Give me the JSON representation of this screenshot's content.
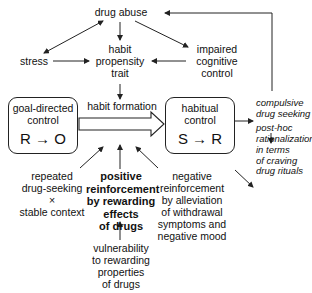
{
  "nodes": {
    "drug_abuse": "drug abuse",
    "stress": "stress",
    "habit_propensity_trait": [
      "habit",
      "propensity",
      "trait"
    ],
    "impaired_cognitive_control": [
      "impaired",
      "cognitive",
      "control"
    ],
    "habit_formation": "habit formation",
    "goal_directed_control": {
      "title": [
        "goal-directed",
        "control"
      ],
      "formula": "R → O"
    },
    "habitual_control": {
      "title": [
        "habitual",
        "control"
      ],
      "formula": "S → R"
    },
    "compulsive_drug_seeking": [
      "compulsive",
      "drug seeking"
    ],
    "post_hoc_rationalization": [
      "post-hoc",
      "rationalization",
      "in terms",
      "of craving"
    ],
    "drug_rituals": "drug rituals",
    "repeated_drug_seeking": [
      "repeated",
      "drug-seeking",
      "×",
      "stable context"
    ],
    "positive_reinforcement": [
      "positive",
      "reinforcement",
      "by rewarding",
      "effects",
      "of drugs"
    ],
    "negative_reinforcement": [
      "negative",
      "reinforcement",
      "by alleviation",
      "of withdrawal",
      "symptoms and",
      "negative mood"
    ],
    "vulnerability": [
      "vulnerability",
      "to rewarding",
      "properties",
      "of drugs"
    ]
  },
  "edges": [
    {
      "from": "drug_abuse",
      "to": "stress",
      "bidirectional": true
    },
    {
      "from": "drug_abuse",
      "to": "habit_propensity_trait"
    },
    {
      "from": "drug_abuse",
      "to": "impaired_cognitive_control"
    },
    {
      "from": "stress",
      "to": "habit_propensity_trait"
    },
    {
      "from": "impaired_cognitive_control",
      "to": "habit_propensity_trait"
    },
    {
      "from": "habit_propensity_trait",
      "to": "habit_formation"
    },
    {
      "from": "goal_directed_control",
      "to": "habitual_control",
      "style": "hollow-block-arrow"
    },
    {
      "from": "repeated_drug_seeking",
      "to": "habit_formation"
    },
    {
      "from": "positive_reinforcement",
      "to": "habit_formation"
    },
    {
      "from": "negative_reinforcement",
      "to": "habit_formation"
    },
    {
      "from": "vulnerability",
      "to": "positive_reinforcement"
    },
    {
      "from": "habitual_control",
      "to": "compulsive_drug_seeking"
    },
    {
      "from": "compulsive_drug_seeking",
      "to": "post_hoc_rationalization"
    },
    {
      "from": "habitual_control",
      "to": "drug_rituals"
    },
    {
      "from": "compulsive_drug_seeking",
      "to": "drug_abuse",
      "style": "feedback-loop"
    }
  ]
}
